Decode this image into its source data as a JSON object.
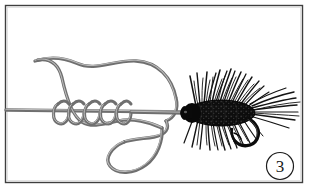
{
  "figure": {
    "background_color": "#ffffff",
    "frame": {
      "name": "illustration-border",
      "stroke_color": "#3a3a3a",
      "x": 5,
      "y": 5,
      "width": 298,
      "height": 178
    },
    "step_badge": {
      "label": "3",
      "circle_stroke": "#1a1a1a",
      "center_x": 280,
      "center_y": 166,
      "radius": 14
    },
    "line": {
      "name": "monofilament-line",
      "color": "#7d7d7d",
      "highlight_color": "#b5b5b5",
      "width": 2.6,
      "standing_end_label": "standing line",
      "tag_end_label": "tag end",
      "wrap_count": 5
    },
    "fly": {
      "name": "woolly-bugger-fly",
      "body_color": "#101010",
      "hackle_color": "#151515",
      "hook_color": "#0d0d0d",
      "eye_color": "#0a0a0a",
      "description": "dark hackled streamer fly with hook"
    }
  }
}
